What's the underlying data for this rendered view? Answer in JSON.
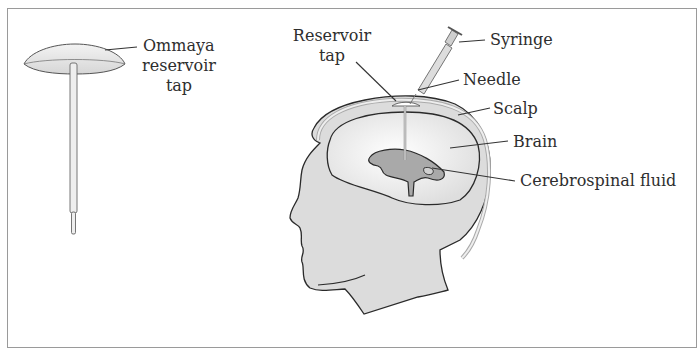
{
  "diagram": {
    "labels": {
      "ommaya": [
        "Ommaya",
        "reservoir",
        "tap"
      ],
      "reservoir_tap": [
        "Reservoir",
        "tap"
      ],
      "syringe": "Syringe",
      "needle": "Needle",
      "scalp": "Scalp",
      "brain": "Brain",
      "csf": "Cerebrospinal fluid"
    },
    "colors": {
      "frame": "#9a9a9a",
      "outline": "#2a2a2a",
      "skin": "#dcdcdc",
      "brain": "#f2f2f2",
      "ventricle": "#a9a9a9",
      "device": "#e6e6e6",
      "text": "#2e2e2e"
    }
  }
}
